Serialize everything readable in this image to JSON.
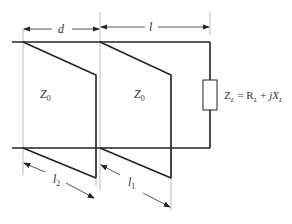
{
  "diagram": {
    "dimensions": {
      "d": "d",
      "l": "l",
      "l1": "l",
      "l1_sub": "1",
      "l2": "l",
      "l2_sub": "2"
    },
    "sections": [
      {
        "label": "Z",
        "sub": "0"
      },
      {
        "label": "Z",
        "sub": "0"
      }
    ],
    "load": {
      "z": "Z",
      "z_sub": "L",
      "eq": " = R",
      "r_sub": "L",
      "plus": " + ",
      "j": "jX",
      "x_sub": "L"
    },
    "colors": {
      "line": "#222222",
      "guide": "#999999",
      "text": "#333333"
    }
  }
}
